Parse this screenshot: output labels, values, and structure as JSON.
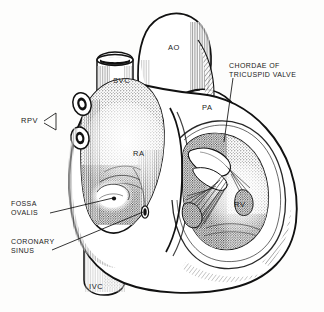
{
  "figure": {
    "style": "black and white line engraving with stipple and hatch shading",
    "background_color": "#fdfdfc",
    "ink_color": "#1a1a1a"
  },
  "labels": [
    {
      "id": "ao",
      "text": "AO",
      "kind": "structure",
      "x": 168,
      "y": 44,
      "meaning": "aorta"
    },
    {
      "id": "svc",
      "text": "SVC",
      "kind": "structure",
      "x": 113,
      "y": 77,
      "meaning": "superior vena cava"
    },
    {
      "id": "pa",
      "text": "PA",
      "kind": "structure",
      "x": 202,
      "y": 104,
      "meaning": "pulmonary artery"
    },
    {
      "id": "ra",
      "text": "RA",
      "kind": "structure",
      "x": 133,
      "y": 150,
      "meaning": "right atrium"
    },
    {
      "id": "rv",
      "text": "RV",
      "kind": "structure",
      "x": 234,
      "y": 201,
      "meaning": "right ventricle"
    },
    {
      "id": "ivc",
      "text": "IVC",
      "kind": "structure",
      "x": 89,
      "y": 283,
      "meaning": "inferior vena cava"
    },
    {
      "id": "rpv",
      "text": "RPV",
      "kind": "leader",
      "x": 21,
      "y": 121,
      "meaning": "right pulmonary veins"
    }
  ],
  "leader_labels": [
    {
      "id": "chordae",
      "lines": [
        "CHORDAE OF",
        "TRICUSPID VALVE"
      ],
      "x": 229,
      "y": 62,
      "meaning": "chordae tendineae of the tricuspid valve"
    },
    {
      "id": "fossa-ovalis",
      "lines": [
        "FOSSA",
        "OVALIS"
      ],
      "x": 11,
      "y": 200,
      "meaning": "fossa ovalis in the interatrial septum"
    },
    {
      "id": "coronary-sinus",
      "lines": [
        "CORONARY",
        "SINUS"
      ],
      "x": 11,
      "y": 238,
      "meaning": "opening of the coronary sinus"
    }
  ],
  "cut_text": {
    "top": "",
    "bottom": ""
  }
}
